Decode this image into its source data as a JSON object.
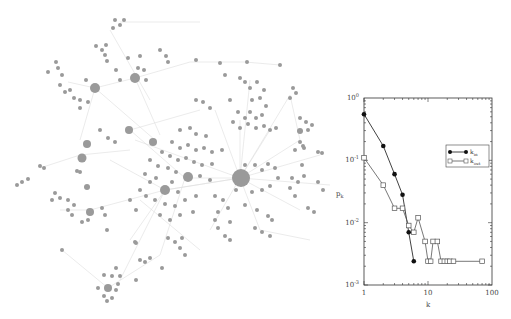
{
  "figure": {
    "left_panel": "Network graph of nodes (grey circles) with hub nodes and light edges",
    "caption_fragment": ""
  },
  "colors": {
    "node": "#9a9a9a",
    "edge": "#dcdcdc",
    "axis": "#333333",
    "series_in": "#111111",
    "series_out": "#555555"
  },
  "chart_data": {
    "type": "line",
    "title": "",
    "xlabel": "k",
    "ylabel": "p_k",
    "xscale": "log",
    "yscale": "log",
    "xlim": [
      1,
      100
    ],
    "ylim": [
      0.001,
      1
    ],
    "x_ticks": [
      "1",
      "10",
      "100"
    ],
    "y_ticks": [
      "10^-3",
      "10^-2",
      "10^-1",
      "10^0"
    ],
    "legend_position": "upper right",
    "grid": false,
    "series": [
      {
        "name": "k_in",
        "marker": "filled-circle",
        "x": [
          1,
          2,
          3,
          4,
          5,
          6
        ],
        "y": [
          0.55,
          0.17,
          0.06,
          0.028,
          0.007,
          0.0024
        ]
      },
      {
        "name": "k_out",
        "marker": "open-square",
        "x": [
          1,
          2,
          3,
          4,
          5,
          6,
          7,
          9,
          10,
          11,
          12,
          14,
          16,
          18,
          20,
          22,
          25,
          70
        ],
        "y": [
          0.11,
          0.04,
          0.017,
          0.017,
          0.009,
          0.007,
          0.012,
          0.005,
          0.0024,
          0.0024,
          0.005,
          0.005,
          0.0024,
          0.0024,
          0.0024,
          0.0024,
          0.0024,
          0.0024
        ]
      }
    ]
  },
  "labels": {
    "ylabel_main": "p",
    "ylabel_sub": "k",
    "xlabel": "k",
    "legend_in_main": "k",
    "legend_in_sub": "in",
    "legend_out_main": "k",
    "legend_out_sub": "out",
    "xtick_1": "1",
    "xtick_10": "10",
    "xtick_100": "100",
    "ytick_0": "0",
    "ytick_m1": "-1",
    "ytick_m2": "-2",
    "ytick_m3": "-3",
    "ytick_base": "10"
  }
}
